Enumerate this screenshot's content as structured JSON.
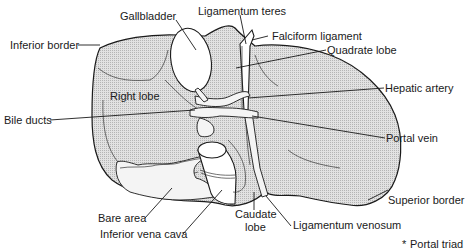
{
  "diagram": {
    "labels": {
      "gallbladder": "Gallbladder",
      "ligamentum_teres": "Ligamentum teres",
      "falciform_ligament": "Falciform ligament",
      "quadrate_lobe": "Quadrate lobe",
      "inferior_border": "Inferior border",
      "right_lobe": "Right lobe",
      "hepatic_artery": "Hepatic artery",
      "bile_ducts": "Bile ducts",
      "portal_vein": "Portal vein",
      "superior_border": "Superior border",
      "bare_area": "Bare area",
      "inferior_vena_cava": "Inferior vena cava",
      "caudate_lobe_1": "Caudate",
      "caudate_lobe_2": "lobe",
      "ligamentum_venosum": "Ligamentum venosum"
    },
    "legend": {
      "marker": "*",
      "text": "Portal triad"
    },
    "colors": {
      "ink": "#1a1a1a",
      "fill_stipple": "#d9d9d9",
      "background": "#ffffff"
    }
  }
}
